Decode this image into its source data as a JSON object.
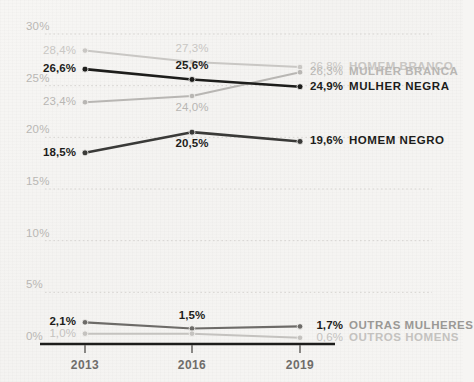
{
  "chart_data": {
    "type": "line",
    "title": "",
    "subtitle": "",
    "xlabel": "",
    "ylabel": "",
    "x": [
      "2013",
      "2016",
      "2019"
    ],
    "categories": [
      "2013",
      "2016",
      "2019"
    ],
    "ylim": [
      0,
      30
    ],
    "yticks": [
      "0%",
      "5%",
      "10%",
      "15%",
      "20%",
      "25%",
      "30%"
    ],
    "ytick_values": [
      0,
      5,
      10,
      15,
      20,
      25,
      30
    ],
    "grid": "horizontal-dotted",
    "legend_position": "right-inline",
    "value_suffix": "%",
    "decimal_separator": ",",
    "series": [
      {
        "name": "HOMEM BRANCO",
        "color": "#c9c7c4",
        "emphasis": "muted",
        "values": [
          28.4,
          27.3,
          26.8
        ],
        "labels": [
          "28,4%",
          "27,3%",
          "26,8%"
        ],
        "label_positions": [
          "above-left",
          "above",
          "right"
        ],
        "end_label": "26,8%"
      },
      {
        "name": "MULHER BRANCA",
        "color": "#b8b6b3",
        "emphasis": "muted",
        "values": [
          23.4,
          24.0,
          26.3
        ],
        "labels": [
          "23,4%",
          "24,0%",
          "26,3%"
        ],
        "label_positions": [
          "below-left",
          "below",
          "right"
        ],
        "end_label": "26,3%"
      },
      {
        "name": "MULHER NEGRA",
        "color": "#1d1d1b",
        "emphasis": "strong",
        "values": [
          26.6,
          25.6,
          24.9
        ],
        "labels": [
          "26,6%",
          "25,6%",
          "24,9%"
        ],
        "label_positions": [
          "above-left",
          "above",
          "right"
        ],
        "end_label": "24,9%"
      },
      {
        "name": "HOMEM NEGRO",
        "color": "#3a3a38",
        "emphasis": "strong",
        "values": [
          18.5,
          20.5,
          19.6
        ],
        "labels": [
          "18,5%",
          "20,5%",
          "19,6%"
        ],
        "label_positions": [
          "below-left",
          "below",
          "right"
        ],
        "end_label": "19,6%"
      },
      {
        "name": "OUTRAS MULHERES",
        "color": "#6d6b68",
        "emphasis": "medium",
        "values": [
          2.1,
          1.5,
          1.7
        ],
        "labels": [
          "2,1%",
          "1,5%",
          "1,7%"
        ],
        "label_positions": [
          "above-left",
          "above",
          "right"
        ],
        "end_label": "1,7%"
      },
      {
        "name": "OUTROS HOMENS",
        "color": "#c4c2bf",
        "emphasis": "muted",
        "values": [
          1.0,
          1.0,
          0.6
        ],
        "labels": [
          "1,0%",
          "",
          "0,6%"
        ],
        "label_positions": [
          "left",
          "",
          "right"
        ],
        "end_label": "0,6%"
      }
    ]
  },
  "axis": {
    "y_ticks": [
      {
        "label": "30%",
        "value": 30
      },
      {
        "label": "25%",
        "value": 25
      },
      {
        "label": "20%",
        "value": 20
      },
      {
        "label": "15%",
        "value": 15
      },
      {
        "label": "10%",
        "value": 10
      },
      {
        "label": "5%",
        "value": 5
      },
      {
        "label": "0%",
        "value": 0
      }
    ],
    "x_ticks": [
      {
        "label": "2013"
      },
      {
        "label": "2016"
      },
      {
        "label": "2019"
      }
    ]
  },
  "colors": {
    "background": "#f6f5f3",
    "axis_line": "#1d1d1b",
    "gridline": "#d6d4d1",
    "tick_text": "#b9b7b4",
    "x_tick_text": "#6f6d6a",
    "strong": "#1d1d1b",
    "muted": "#c9c7c4",
    "medium": "#6d6b68"
  }
}
